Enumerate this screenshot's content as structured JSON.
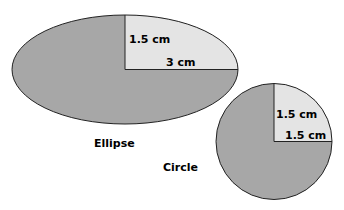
{
  "figure": {
    "ellipse": {
      "caption": "Ellipse",
      "semi_minor_label": "1.5 cm",
      "semi_major_label": "3 cm",
      "fill": "#a7a7a7",
      "quadrant_fill": "#e4e4e4"
    },
    "circle": {
      "caption": "Circle",
      "radius_vertical_label": "1.5 cm",
      "radius_horizontal_label": "1.5 cm",
      "fill": "#a7a7a7",
      "quadrant_fill": "#e4e4e4"
    }
  }
}
